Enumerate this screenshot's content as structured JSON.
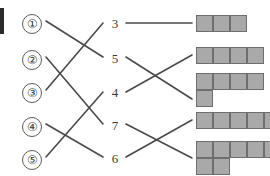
{
  "diagram": {
    "type": "matching-diagram",
    "edge_mark": {
      "name": "page-edge-mark",
      "color": "#2b2b2b"
    },
    "colors": {
      "line": "#4a4a4a",
      "cell_fill": "#a9a9a9",
      "cell_border": "#6e6e6e",
      "text": "#3a3a3a"
    },
    "left_column": {
      "label": "circled-numbers",
      "items": [
        {
          "id": "c1",
          "label": "①",
          "x": 22,
          "y": 14
        },
        {
          "id": "c2",
          "label": "②",
          "x": 22,
          "y": 50
        },
        {
          "id": "c3",
          "label": "③",
          "x": 22,
          "y": 83
        },
        {
          "id": "c4",
          "label": "④",
          "x": 22,
          "y": 117
        },
        {
          "id": "c5",
          "label": "⑤",
          "x": 22,
          "y": 150
        }
      ]
    },
    "middle_column": {
      "label": "count-numbers",
      "items": [
        {
          "id": "n1",
          "label": "3",
          "x": 108,
          "y": 16
        },
        {
          "id": "n2",
          "label": "5",
          "x": 108,
          "y": 51
        },
        {
          "id": "n3",
          "label": "4",
          "x": 108,
          "y": 85
        },
        {
          "id": "n4",
          "label": "7",
          "x": 108,
          "y": 118
        },
        {
          "id": "n5",
          "label": "6",
          "x": 108,
          "y": 151
        }
      ]
    },
    "right_column": {
      "label": "polyomino-shapes",
      "items": [
        {
          "id": "s1",
          "name": "shape-3-bar",
          "cell_count": 3,
          "x": 196,
          "y": 15,
          "cell": 17,
          "cells": [
            [
              0,
              0
            ],
            [
              1,
              0
            ],
            [
              2,
              0
            ]
          ]
        },
        {
          "id": "s2",
          "name": "shape-4-bar",
          "cell_count": 4,
          "x": 196,
          "y": 47,
          "cell": 17,
          "cells": [
            [
              0,
              0
            ],
            [
              1,
              0
            ],
            [
              2,
              0
            ],
            [
              3,
              0
            ]
          ]
        },
        {
          "id": "s3",
          "name": "shape-5-L",
          "cell_count": 5,
          "x": 196,
          "y": 73,
          "cell": 17,
          "cells": [
            [
              0,
              0
            ],
            [
              1,
              0
            ],
            [
              2,
              0
            ],
            [
              3,
              0
            ],
            [
              0,
              1
            ]
          ]
        },
        {
          "id": "s4",
          "name": "shape-5-bar",
          "cell_count": 5,
          "x": 196,
          "y": 112,
          "cell": 17,
          "cells": [
            [
              0,
              0
            ],
            [
              1,
              0
            ],
            [
              2,
              0
            ],
            [
              3,
              0
            ],
            [
              4,
              0
            ]
          ]
        },
        {
          "id": "s5",
          "name": "shape-7-L",
          "cell_count": 7,
          "x": 196,
          "y": 141,
          "cell": 17,
          "cells": [
            [
              0,
              0
            ],
            [
              1,
              0
            ],
            [
              2,
              0
            ],
            [
              3,
              0
            ],
            [
              4,
              0
            ],
            [
              0,
              1
            ],
            [
              1,
              1
            ]
          ]
        }
      ]
    },
    "connections": {
      "left_to_middle": [
        {
          "from": "c1",
          "to": "n2",
          "x1": 46,
          "y1": 21,
          "x2": 103,
          "y2": 57
        },
        {
          "from": "c2",
          "to": "n4",
          "x1": 46,
          "y1": 57,
          "x2": 103,
          "y2": 124
        },
        {
          "from": "c3",
          "to": "n1",
          "x1": 46,
          "y1": 90,
          "x2": 103,
          "y2": 23
        },
        {
          "from": "c4",
          "to": "n5",
          "x1": 46,
          "y1": 124,
          "x2": 103,
          "y2": 157
        },
        {
          "from": "c5",
          "to": "n3",
          "x1": 46,
          "y1": 157,
          "x2": 103,
          "y2": 92
        }
      ],
      "middle_to_right": [
        {
          "from": "n1",
          "to": "s1",
          "x1": 126,
          "y1": 23,
          "x2": 192,
          "y2": 23
        },
        {
          "from": "n2",
          "to": "s3",
          "x1": 126,
          "y1": 57,
          "x2": 192,
          "y2": 99
        },
        {
          "from": "n3",
          "to": "s2",
          "x1": 126,
          "y1": 92,
          "x2": 192,
          "y2": 55
        },
        {
          "from": "n4",
          "to": "s5",
          "x1": 126,
          "y1": 124,
          "x2": 192,
          "y2": 158
        },
        {
          "from": "n5",
          "to": "s4",
          "x1": 126,
          "y1": 157,
          "x2": 192,
          "y2": 120
        }
      ]
    }
  }
}
